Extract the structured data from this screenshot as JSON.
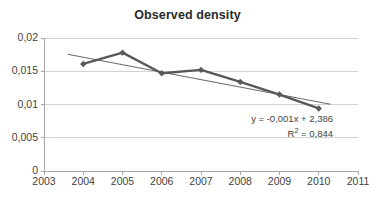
{
  "chart_data": {
    "type": "line",
    "title": "Observed density",
    "xlabel": "",
    "ylabel": "",
    "x": [
      2004,
      2005,
      2006,
      2007,
      2008,
      2009,
      2010
    ],
    "values": [
      0.0161,
      0.0178,
      0.0147,
      0.0152,
      0.0134,
      0.0115,
      0.0094
    ],
    "series": [
      {
        "name": "Observed density",
        "values": [
          0.0161,
          0.0178,
          0.0147,
          0.0152,
          0.0134,
          0.0115,
          0.0094
        ],
        "color": "#595959",
        "marker": "diamond"
      },
      {
        "name": "Linear trendline",
        "type": "trendline",
        "x": [
          2003.6,
          2010.3
        ],
        "values": [
          0.01755,
          0.01005
        ],
        "color": "#6b6b6b"
      }
    ],
    "xlim": [
      2003,
      2011
    ],
    "ylim": [
      0,
      0.02
    ],
    "xticks": [
      2003,
      2004,
      2005,
      2006,
      2007,
      2008,
      2009,
      2010,
      2011
    ],
    "xtick_labels": [
      "2003",
      "2004",
      "2005",
      "2006",
      "2007",
      "2008",
      "2009",
      "2010",
      "2011"
    ],
    "yticks": [
      0,
      0.005,
      0.01,
      0.015,
      0.02
    ],
    "ytick_labels": [
      "0",
      "0,005",
      "0,01",
      "0,015",
      "0,02"
    ],
    "grid": "horizontal",
    "legend": "none",
    "annotations": {
      "equation": "y = -0,001x + 2,386",
      "r_squared_prefix": "R",
      "r_squared_exponent": "2",
      "r_squared_value": " = 0,844"
    },
    "colors": {
      "series": "#595959",
      "trendline": "#6b6b6b",
      "grid": "#c8c8c8",
      "axis": "#a6a6a6",
      "text": "#3f3f3f",
      "title": "#2b2b2b",
      "background": "#ffffff"
    }
  }
}
